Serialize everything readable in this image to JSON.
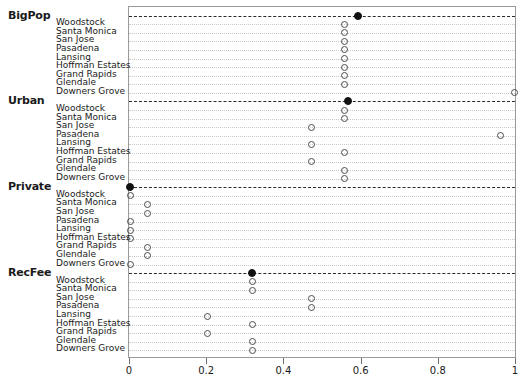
{
  "chart_data": {
    "type": "scatter",
    "title": "",
    "xlabel": "",
    "ylabel": "",
    "xlim": [
      0,
      1
    ],
    "grid": true,
    "legend_position": "none",
    "xticks": [
      0,
      0.2,
      0.4,
      0.6,
      0.8,
      1
    ],
    "xtick_labels": [
      "0",
      "0.2",
      "0.4",
      "0.6",
      "0.8",
      "1"
    ],
    "categories": [
      "Woodstock",
      "Santa Monica",
      "San Jose",
      "Pasadena",
      "Lansing",
      "Hoffman Estates",
      "Grand Rapids",
      "Glendale",
      "Downers Grove"
    ],
    "marker_styles": {
      "group_value": "filled-circle",
      "category_value": "open-circle"
    },
    "panels": [
      {
        "name": "BigPop",
        "group_value": 0.59,
        "values": [
          0.555,
          0.555,
          0.555,
          0.555,
          0.555,
          0.555,
          0.555,
          0.555,
          0.995
        ]
      },
      {
        "name": "Urban",
        "group_value": 0.565,
        "values": [
          0.555,
          0.555,
          0.47,
          0.96,
          0.47,
          0.555,
          0.47,
          0.555,
          0.555
        ]
      },
      {
        "name": "Private",
        "group_value": 0.0,
        "values": [
          0.0,
          0.045,
          0.045,
          0.0,
          0.0,
          0.0,
          0.045,
          0.045,
          0.0
        ]
      },
      {
        "name": "RecFee",
        "group_value": 0.317,
        "values": [
          0.317,
          0.317,
          0.47,
          0.47,
          0.2,
          0.317,
          0.2,
          0.317,
          0.317
        ]
      }
    ]
  }
}
